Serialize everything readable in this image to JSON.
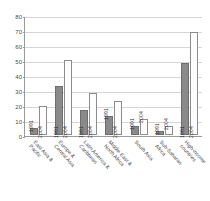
{
  "chart_data": {
    "type": "bar",
    "title": "",
    "xlabel": "",
    "ylabel": "",
    "ylim": [
      0,
      80
    ],
    "yticks": [
      0,
      10,
      20,
      30,
      40,
      50,
      60,
      70,
      80
    ],
    "grid": true,
    "legend_position": "none",
    "categories": [
      "East Asia &\nPacific",
      "Europe &\nCentral Asia",
      "Latin America &\nCaribbean",
      "Middle East &\nNorth Africa",
      "South Asia",
      "Sub-Saharan\nAfrica",
      "High-income\ncountries"
    ],
    "series": [
      {
        "name": "1991",
        "values": [
          4.5,
          33,
          17,
          12.5,
          6,
          3,
          48
        ],
        "color": "#8a8a8a"
      },
      {
        "name": "2004",
        "values": [
          19.5,
          50,
          28,
          23,
          10.5,
          6,
          69
        ],
        "color": "#fdfdfd"
      }
    ],
    "bar_labels": [
      "1991",
      "2004"
    ]
  },
  "scan": {
    "top_artifact": "",
    "bottom_artifact": ""
  }
}
